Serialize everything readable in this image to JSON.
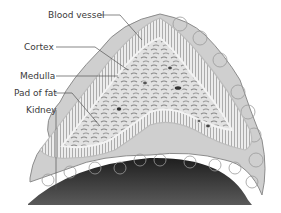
{
  "diagram": {
    "labels": [
      {
        "id": "blood-vessel",
        "text": "Blood vessel",
        "x": 48,
        "y": 10
      },
      {
        "id": "cortex",
        "text": "Cortex",
        "x": 24,
        "y": 42
      },
      {
        "id": "medulla",
        "text": "Medulla",
        "x": 20,
        "y": 72
      },
      {
        "id": "pad-of-fat",
        "text": "Pad of fat",
        "x": 14,
        "y": 89
      },
      {
        "id": "kidney",
        "text": "Kidney",
        "x": 26,
        "y": 108
      }
    ],
    "colors": {
      "label_text": "#3a3a3a",
      "leader_line": "#555555",
      "cortex_fill": "#e9e9e9",
      "cortex_stripes": "#6a6a6a",
      "medulla_fill": "#dcdcdc",
      "fat_fill": "#c9c9c9",
      "kidney_fill": "#2e2e2e"
    }
  }
}
